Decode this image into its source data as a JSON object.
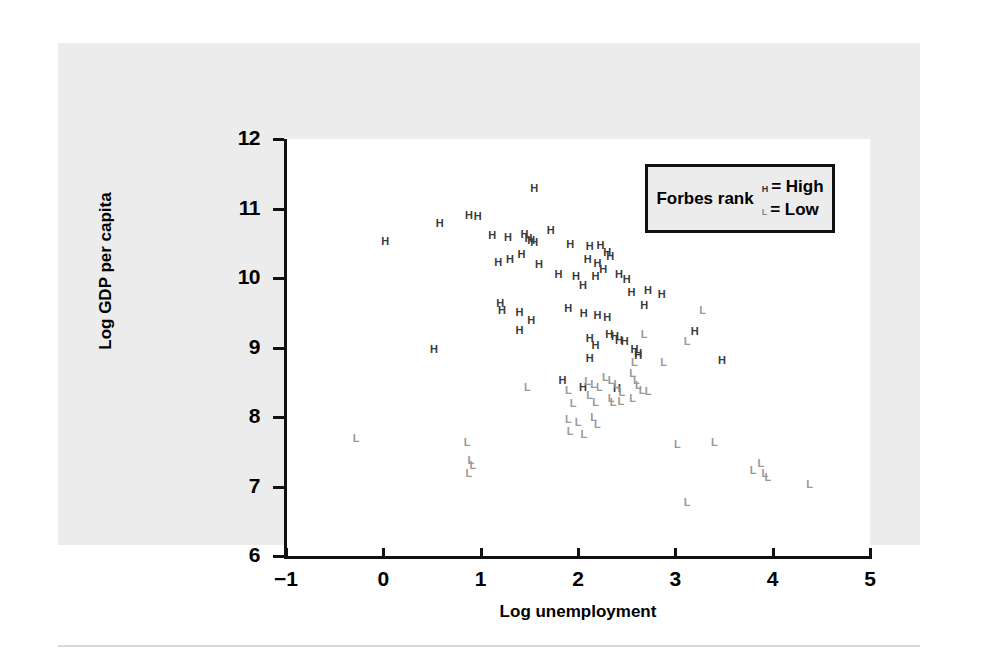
{
  "chart_data": {
    "type": "scatter",
    "title": "",
    "xlabel": "Log unemployment",
    "ylabel": "Log GDP per capita",
    "xlim": [
      -1,
      5
    ],
    "ylim": [
      6,
      12
    ],
    "xticks": [
      "-1",
      "0",
      "1",
      "2",
      "3",
      "4",
      "5"
    ],
    "yticks": [
      "6",
      "7",
      "8",
      "9",
      "10",
      "11",
      "12"
    ],
    "grid": false,
    "legend": {
      "position": "top-right",
      "title": "Forbes rank",
      "entries": [
        {
          "marker": "H",
          "label": "= High"
        },
        {
          "marker": "L",
          "label": "= Low"
        }
      ]
    },
    "series": [
      {
        "name": "High",
        "marker": "H",
        "color": "#3a3a3a",
        "points": [
          [
            0.02,
            10.52
          ],
          [
            0.58,
            10.78
          ],
          [
            0.88,
            10.89
          ],
          [
            0.97,
            10.88
          ],
          [
            1.55,
            11.28
          ],
          [
            1.12,
            10.6
          ],
          [
            1.28,
            10.58
          ],
          [
            1.45,
            10.62
          ],
          [
            1.49,
            10.56
          ],
          [
            1.52,
            10.53
          ],
          [
            1.55,
            10.5
          ],
          [
            1.72,
            10.67
          ],
          [
            1.92,
            10.48
          ],
          [
            2.12,
            10.44
          ],
          [
            2.23,
            10.46
          ],
          [
            2.3,
            10.36
          ],
          [
            2.33,
            10.3
          ],
          [
            1.18,
            10.22
          ],
          [
            1.3,
            10.26
          ],
          [
            1.42,
            10.33
          ],
          [
            1.6,
            10.18
          ],
          [
            2.1,
            10.26
          ],
          [
            2.2,
            10.2
          ],
          [
            2.26,
            10.12
          ],
          [
            1.8,
            10.05
          ],
          [
            1.98,
            10.02
          ],
          [
            2.18,
            10.01
          ],
          [
            2.42,
            10.04
          ],
          [
            2.5,
            9.97
          ],
          [
            2.05,
            9.88
          ],
          [
            2.55,
            9.78
          ],
          [
            2.72,
            9.82
          ],
          [
            2.86,
            9.75
          ],
          [
            1.2,
            9.62
          ],
          [
            1.22,
            9.52
          ],
          [
            1.4,
            9.5
          ],
          [
            1.52,
            9.38
          ],
          [
            1.9,
            9.55
          ],
          [
            2.06,
            9.48
          ],
          [
            2.2,
            9.45
          ],
          [
            2.3,
            9.42
          ],
          [
            2.68,
            9.6
          ],
          [
            3.2,
            9.22
          ],
          [
            1.4,
            9.24
          ],
          [
            0.52,
            8.96
          ],
          [
            2.12,
            9.12
          ],
          [
            2.18,
            9.02
          ],
          [
            2.32,
            9.18
          ],
          [
            2.38,
            9.15
          ],
          [
            2.42,
            9.1
          ],
          [
            2.48,
            9.08
          ],
          [
            2.58,
            8.96
          ],
          [
            2.62,
            8.9
          ],
          [
            2.12,
            8.84
          ],
          [
            3.48,
            8.8
          ],
          [
            1.84,
            8.52
          ],
          [
            2.05,
            8.42
          ],
          [
            2.4,
            8.4
          ],
          [
            2.62,
            8.88
          ]
        ]
      },
      {
        "name": "Low",
        "marker": "L",
        "color": "#9a9a9a",
        "points": [
          [
            3.28,
            9.52
          ],
          [
            3.12,
            9.08
          ],
          [
            2.68,
            9.18
          ],
          [
            2.58,
            8.78
          ],
          [
            2.56,
            8.62
          ],
          [
            2.6,
            8.52
          ],
          [
            2.62,
            8.44
          ],
          [
            2.66,
            8.38
          ],
          [
            2.72,
            8.36
          ],
          [
            2.56,
            8.26
          ],
          [
            1.48,
            8.42
          ],
          [
            1.9,
            8.38
          ],
          [
            2.1,
            8.5
          ],
          [
            2.16,
            8.46
          ],
          [
            2.22,
            8.42
          ],
          [
            2.28,
            8.56
          ],
          [
            2.34,
            8.52
          ],
          [
            2.4,
            8.46
          ],
          [
            2.45,
            8.34
          ],
          [
            2.34,
            8.26
          ],
          [
            2.12,
            8.3
          ],
          [
            2.44,
            8.22
          ],
          [
            1.95,
            8.18
          ],
          [
            2.18,
            8.2
          ],
          [
            2.36,
            8.2
          ],
          [
            1.9,
            7.96
          ],
          [
            2.0,
            7.92
          ],
          [
            2.16,
            7.98
          ],
          [
            2.2,
            7.88
          ],
          [
            1.92,
            7.78
          ],
          [
            2.06,
            7.74
          ],
          [
            -0.28,
            7.68
          ],
          [
            0.86,
            7.62
          ],
          [
            3.02,
            7.6
          ],
          [
            3.4,
            7.62
          ],
          [
            0.9,
            7.36
          ],
          [
            0.92,
            7.3
          ],
          [
            0.88,
            7.18
          ],
          [
            3.8,
            7.22
          ],
          [
            3.88,
            7.32
          ],
          [
            3.92,
            7.18
          ],
          [
            3.95,
            7.12
          ],
          [
            4.38,
            7.02
          ],
          [
            3.12,
            6.76
          ],
          [
            2.88,
            8.78
          ]
        ]
      }
    ]
  }
}
